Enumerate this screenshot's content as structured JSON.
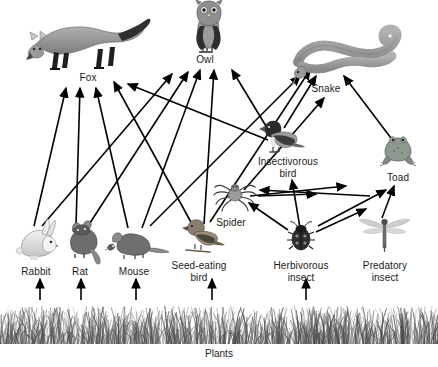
{
  "diagram": {
    "background_color": "#ffffff",
    "line_color": "#000000",
    "text_color": "#1a1a1a",
    "width": 438,
    "height": 367
  },
  "producer": {
    "label": "Plants",
    "icon": "grass-icon",
    "label_x": 219,
    "label_y": 348,
    "band_top": 302,
    "band_height": 42
  },
  "nodes": [
    {
      "id": "fox",
      "label": "Fox",
      "icon": "fox-icon",
      "trophic": "tertiary-consumer",
      "label_x": 88,
      "label_y": 72,
      "art_x": 88,
      "art_y": 40,
      "art_w": 120,
      "art_h": 58
    },
    {
      "id": "owl",
      "label": "Owl",
      "icon": "owl-icon",
      "trophic": "tertiary-consumer",
      "label_x": 205,
      "label_y": 54,
      "art_x": 209,
      "art_y": 26,
      "art_w": 44,
      "art_h": 50
    },
    {
      "id": "snake",
      "label": "Snake",
      "icon": "snake-icon",
      "trophic": "tertiary-consumer",
      "label_x": 326,
      "label_y": 83,
      "art_x": 348,
      "art_y": 48,
      "art_w": 110,
      "art_h": 48
    },
    {
      "id": "insectivorous_bird",
      "label": "Insectivorous\nbird",
      "icon": "insectivorous-bird-icon",
      "trophic": "secondary-consumer",
      "label_x": 288,
      "label_y": 156,
      "art_x": 277,
      "art_y": 135,
      "art_w": 40,
      "art_h": 32
    },
    {
      "id": "toad",
      "label": "Toad",
      "icon": "toad-icon",
      "trophic": "secondary-consumer",
      "label_x": 398,
      "label_y": 172,
      "art_x": 398,
      "art_y": 148,
      "art_w": 36,
      "art_h": 32
    },
    {
      "id": "spider",
      "label": "Spider",
      "icon": "spider-icon",
      "trophic": "secondary-consumer",
      "label_x": 231,
      "label_y": 217,
      "art_x": 235,
      "art_y": 193,
      "art_w": 40,
      "art_h": 30
    },
    {
      "id": "rabbit",
      "label": "Rabbit",
      "icon": "rabbit-icon",
      "trophic": "primary-consumer",
      "label_x": 36,
      "label_y": 266,
      "art_x": 36,
      "art_y": 238,
      "art_w": 44,
      "art_h": 40
    },
    {
      "id": "rat",
      "label": "Rat",
      "icon": "rat-icon",
      "trophic": "primary-consumer",
      "label_x": 80,
      "label_y": 266,
      "art_x": 81,
      "art_y": 238,
      "art_w": 42,
      "art_h": 38
    },
    {
      "id": "mouse",
      "label": "Mouse",
      "icon": "mouse-icon",
      "trophic": "primary-consumer",
      "label_x": 134,
      "label_y": 266,
      "art_x": 133,
      "art_y": 242,
      "art_w": 50,
      "art_h": 30
    },
    {
      "id": "seed_eating_bird",
      "label": "Seed-eating\nbird",
      "icon": "seed-eating-bird-icon",
      "trophic": "primary-consumer",
      "label_x": 199,
      "label_y": 260,
      "art_x": 198,
      "art_y": 236,
      "art_w": 40,
      "art_h": 32
    },
    {
      "id": "herbivorous_insect",
      "label": "Herbivorous\ninsect",
      "icon": "ladybug-icon",
      "trophic": "primary-consumer",
      "label_x": 301,
      "label_y": 260,
      "art_x": 301,
      "art_y": 238,
      "art_w": 26,
      "art_h": 28
    },
    {
      "id": "predatory_insect",
      "label": "Predatory\ninsect",
      "icon": "dragonfly-icon",
      "trophic": "secondary-consumer",
      "label_x": 385,
      "label_y": 260,
      "art_x": 385,
      "art_y": 230,
      "art_w": 50,
      "art_h": 30
    }
  ],
  "edges": [
    {
      "from": "plants",
      "to": "rabbit",
      "x1": 40,
      "y1": 300,
      "x2": 40,
      "y2": 279
    },
    {
      "from": "plants",
      "to": "rat",
      "x1": 81,
      "y1": 300,
      "x2": 81,
      "y2": 279
    },
    {
      "from": "plants",
      "to": "mouse",
      "x1": 136,
      "y1": 300,
      "x2": 136,
      "y2": 279
    },
    {
      "from": "plants",
      "to": "seed_eating_bird",
      "x1": 212,
      "y1": 300,
      "x2": 212,
      "y2": 279
    },
    {
      "from": "plants",
      "to": "herbivorous_insect",
      "x1": 306,
      "y1": 300,
      "x2": 306,
      "y2": 279
    },
    {
      "from": "rabbit",
      "to": "fox",
      "x1": 34,
      "y1": 226,
      "x2": 66,
      "y2": 88
    },
    {
      "from": "rabbit",
      "to": "owl",
      "x1": 42,
      "y1": 226,
      "x2": 172,
      "y2": 74
    },
    {
      "from": "rat",
      "to": "fox",
      "x1": 76,
      "y1": 226,
      "x2": 80,
      "y2": 88
    },
    {
      "from": "rat",
      "to": "owl",
      "x1": 88,
      "y1": 226,
      "x2": 188,
      "y2": 72
    },
    {
      "from": "mouse",
      "to": "fox",
      "x1": 128,
      "y1": 228,
      "x2": 96,
      "y2": 88
    },
    {
      "from": "mouse",
      "to": "owl",
      "x1": 142,
      "y1": 228,
      "x2": 200,
      "y2": 70
    },
    {
      "from": "mouse",
      "to": "snake",
      "x1": 150,
      "y1": 226,
      "x2": 300,
      "y2": 76
    },
    {
      "from": "seed_eating_bird",
      "to": "fox",
      "x1": 192,
      "y1": 224,
      "x2": 114,
      "y2": 82
    },
    {
      "from": "seed_eating_bird",
      "to": "owl",
      "x1": 204,
      "y1": 224,
      "x2": 214,
      "y2": 70
    },
    {
      "from": "seed_eating_bird",
      "to": "snake",
      "x1": 210,
      "y1": 222,
      "x2": 310,
      "y2": 70
    },
    {
      "from": "insectivorous_bird",
      "to": "fox",
      "x1": 268,
      "y1": 140,
      "x2": 128,
      "y2": 84
    },
    {
      "from": "insectivorous_bird",
      "to": "owl",
      "x1": 272,
      "y1": 136,
      "x2": 232,
      "y2": 70
    },
    {
      "from": "insectivorous_bird",
      "to": "snake",
      "x1": 284,
      "y1": 128,
      "x2": 316,
      "y2": 76
    },
    {
      "from": "herbivorous_insect",
      "to": "spider",
      "x1": 288,
      "y1": 230,
      "x2": 249,
      "y2": 203
    },
    {
      "from": "herbivorous_insect",
      "to": "predatory_insect",
      "x1": 316,
      "y1": 232,
      "x2": 366,
      "y2": 209
    },
    {
      "from": "herbivorous_insect",
      "to": "insectivorous_bird",
      "x1": 300,
      "y1": 228,
      "x2": 292,
      "y2": 180
    },
    {
      "from": "herbivorous_insect",
      "to": "toad",
      "x1": 318,
      "y1": 226,
      "x2": 386,
      "y2": 190
    },
    {
      "from": "spider",
      "to": "insectivorous_bird",
      "x1": 250,
      "y1": 196,
      "x2": 346,
      "y2": 186
    },
    {
      "from": "predatory_insect",
      "to": "insectivorous_bird",
      "x1": 370,
      "y1": 196,
      "x2": 260,
      "y2": 190
    },
    {
      "from": "predatory_insect",
      "to": "toad",
      "x1": 382,
      "y1": 218,
      "x2": 394,
      "y2": 186
    },
    {
      "from": "toad",
      "to": "snake",
      "x1": 394,
      "y1": 142,
      "x2": 344,
      "y2": 76
    },
    {
      "from": "spider",
      "to": "snake",
      "x1": 244,
      "y1": 190,
      "x2": 324,
      "y2": 98
    },
    {
      "from": "insectivorous_bird",
      "to": "owl2",
      "x1": 258,
      "y1": 196,
      "x2": 316,
      "y2": 194
    }
  ]
}
